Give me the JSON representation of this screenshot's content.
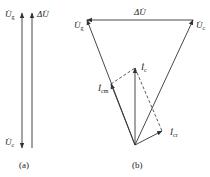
{
  "panel_a": {
    "caption": "(a)",
    "labels": {
      "ug": {
        "base": "U̇",
        "sub": "g"
      },
      "delta_u": {
        "base": "ΔU̇"
      },
      "uc": {
        "base": "U̇",
        "sub": "c"
      }
    }
  },
  "panel_b": {
    "caption": "(b)",
    "labels": {
      "delta_u": {
        "base": "ΔU̇"
      },
      "ug": {
        "base": "U̇",
        "sub": "g"
      },
      "uc": {
        "base": "U̇",
        "sub": "c"
      },
      "ic": {
        "base": "İ",
        "sub": "c"
      },
      "icm": {
        "base": "İ",
        "sub": "cm"
      },
      "icr": {
        "base": "İ",
        "sub": "cr"
      }
    }
  },
  "colors": {
    "line": "#333333",
    "background": "#ffffff"
  }
}
